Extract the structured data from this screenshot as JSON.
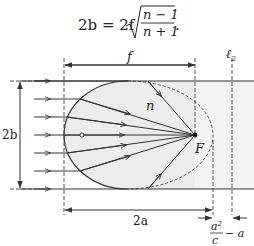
{
  "formula": {
    "lhs": "2b = 2f",
    "numerator": "n − 1",
    "denominator": "n + 1",
    "trail": "."
  },
  "labels": {
    "f": "f",
    "l2": "ℓ",
    "l2_sub": "2",
    "two_b": "2b",
    "n": "n",
    "F": "F",
    "two_a": "2a",
    "frac_num": "a",
    "frac_num_sup": "2",
    "frac_den": "c",
    "frac_tail": "− a"
  },
  "colors": {
    "line": "#333333",
    "fill": "#ececec",
    "shade": "#f4f4f4"
  }
}
